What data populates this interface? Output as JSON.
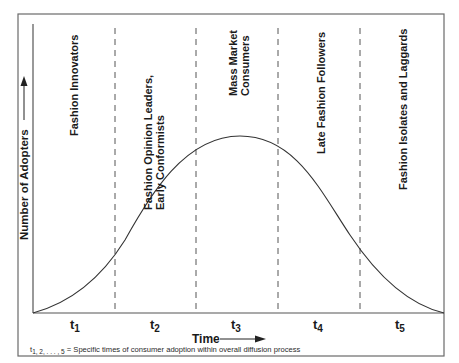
{
  "figure": {
    "y_axis_label": "Number of Adopters",
    "x_axis_label": "Time",
    "footnote": {
      "prefix_t": "t",
      "prefix_sub": "1, 2, . . . , 5",
      "text": " = Specific times of consumer adoption within overall diffusion process"
    },
    "stages": [
      {
        "id": "stage-1",
        "lines": [
          "Fashion Innovators"
        ]
      },
      {
        "id": "stage-2",
        "lines": [
          "Fashion Opinion Leaders,",
          "Early Conformists"
        ]
      },
      {
        "id": "stage-3",
        "lines": [
          "Mass Market",
          "Consumers"
        ]
      },
      {
        "id": "stage-4",
        "lines": [
          "Late Fashion Followers"
        ]
      },
      {
        "id": "stage-5",
        "lines": [
          "Fashion Isolates and Laggards"
        ]
      }
    ],
    "time_ticks": [
      {
        "t": "t",
        "sub": "1"
      },
      {
        "t": "t",
        "sub": "2"
      },
      {
        "t": "t",
        "sub": "3"
      },
      {
        "t": "t",
        "sub": "4"
      },
      {
        "t": "t",
        "sub": "5"
      }
    ],
    "colors": {
      "line": "#333333",
      "frame": "#666666",
      "text": "#1a1a1a"
    }
  }
}
